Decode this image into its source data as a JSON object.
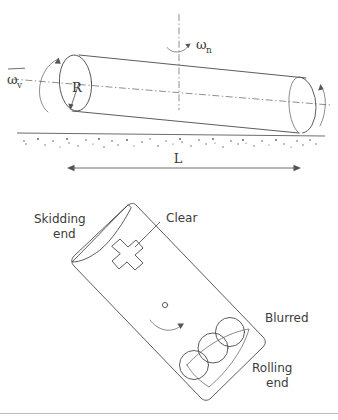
{
  "figure": {
    "background_color": "#ffffff",
    "ink_color": "#4a4a4a",
    "panels": [
      {
        "id": "upper-panel",
        "name": "cylinder-perspective-view",
        "description": "Inclined cylinder resting on a speckled ground line with rotation axes",
        "labels": {
          "omega_v": "ω",
          "omega_v_subscript": "v",
          "omega_v_overbar": true,
          "omega_n": "ω",
          "omega_n_subscript": "n",
          "omega_n_overbar": false,
          "radius": "R",
          "length": "L"
        },
        "elements": [
          "vertical-dash-dot-axis",
          "longitudinal-dash-dot-axis",
          "left-end-ellipse",
          "right-end-ellipse",
          "cylinder-top-edge",
          "cylinder-bottom-edge",
          "radius-arrow",
          "omega-v-curved-arrow",
          "omega-n-curved-arrow",
          "right-end-curved-arrow",
          "ground-line",
          "debris-speckles",
          "length-dimension-arrow"
        ]
      },
      {
        "id": "lower-panel",
        "name": "track-mark-plan-view",
        "description": "Tilted rectangular track mark showing skidding end, clear zone, rotation arrow and blurred rolling end with three overlapping circles",
        "labels": {
          "skidding_end_line1": "Skidding",
          "skidding_end_line2": "end",
          "clear": "Clear",
          "blurred": "Blurred",
          "rolling_end_line1": "Rolling",
          "rolling_end_line2": "end"
        },
        "elements": [
          "track-outline",
          "skidding-end-wedge",
          "cross-mark",
          "clear-leader-line",
          "small-circle-marker",
          "rotation-curved-arrow",
          "rolling-end-lens",
          "overlapping-circle-1",
          "overlapping-circle-2",
          "overlapping-circle-3"
        ]
      }
    ]
  }
}
